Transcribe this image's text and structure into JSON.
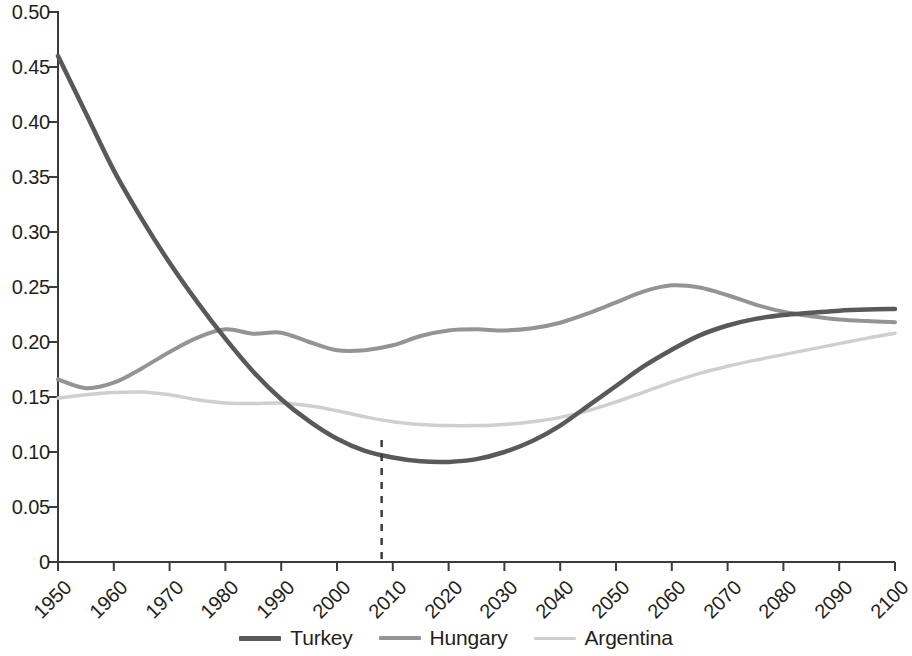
{
  "chart_data": {
    "type": "line",
    "title": "",
    "xlabel": "",
    "ylabel": "",
    "xlim": [
      1950,
      2100
    ],
    "ylim": [
      0,
      0.5
    ],
    "grid": false,
    "legend_position": "bottom",
    "x_ticks": [
      "1950",
      "1960",
      "1970",
      "1980",
      "1990",
      "2000",
      "2010",
      "2020",
      "2030",
      "2040",
      "2050",
      "2060",
      "2070",
      "2080",
      "2090",
      "2100"
    ],
    "y_ticks": [
      "0",
      "0.05",
      "0.10",
      "0.15",
      "0.20",
      "0.25",
      "0.30",
      "0.35",
      "0.40",
      "0.45",
      "0.50"
    ],
    "y_tick_values": [
      0,
      0.05,
      0.1,
      0.15,
      0.2,
      0.25,
      0.3,
      0.35,
      0.4,
      0.45,
      0.5
    ],
    "x": [
      1950,
      1955,
      1960,
      1965,
      1970,
      1975,
      1980,
      1985,
      1990,
      1995,
      2000,
      2005,
      2010,
      2015,
      2020,
      2025,
      2030,
      2035,
      2040,
      2045,
      2050,
      2055,
      2060,
      2065,
      2070,
      2075,
      2080,
      2085,
      2090,
      2095,
      2100
    ],
    "series": [
      {
        "name": "Turkey",
        "color": "#595959",
        "width": 4.5,
        "dash": "none",
        "values": [
          0.46,
          0.408,
          0.356,
          0.312,
          0.272,
          0.236,
          0.203,
          0.173,
          0.148,
          0.128,
          0.112,
          0.101,
          0.095,
          0.0915,
          0.091,
          0.0935,
          0.1,
          0.11,
          0.124,
          0.142,
          0.16,
          0.178,
          0.193,
          0.206,
          0.215,
          0.221,
          0.2245,
          0.2265,
          0.2285,
          0.2295,
          0.23
        ]
      },
      {
        "name": "Hungary",
        "color": "#949494",
        "width": 4.0,
        "dash": "none",
        "values": [
          0.166,
          0.158,
          0.163,
          0.176,
          0.191,
          0.204,
          0.2115,
          0.2075,
          0.2085,
          0.2,
          0.1925,
          0.1925,
          0.197,
          0.2055,
          0.2105,
          0.2115,
          0.2105,
          0.2125,
          0.2175,
          0.226,
          0.236,
          0.246,
          0.2515,
          0.2495,
          0.2425,
          0.234,
          0.2275,
          0.2235,
          0.2205,
          0.219,
          0.218
        ]
      },
      {
        "name": "Argentina",
        "color": "#cfcfcf",
        "width": 3.5,
        "dash": "none",
        "values": [
          0.149,
          0.152,
          0.154,
          0.1545,
          0.152,
          0.1475,
          0.1445,
          0.144,
          0.1445,
          0.142,
          0.1375,
          0.132,
          0.1275,
          0.125,
          0.124,
          0.124,
          0.125,
          0.1275,
          0.1315,
          0.1375,
          0.1455,
          0.1545,
          0.1635,
          0.1715,
          0.178,
          0.1835,
          0.1885,
          0.1935,
          0.1985,
          0.2035,
          0.208
        ]
      }
    ],
    "annotations": [
      {
        "name": "reference-line-2008",
        "type": "vline",
        "x": 2008,
        "y_top": 0.111,
        "y_bottom": 0,
        "style": "dashed",
        "color": "#3b3b3b"
      }
    ]
  },
  "axis": {
    "line_color": "#3b3b3b",
    "tick_color": "#3b3b3b"
  },
  "legend": {
    "items": [
      {
        "label": "Turkey",
        "color": "#595959"
      },
      {
        "label": "Hungary",
        "color": "#949494"
      },
      {
        "label": "Argentina",
        "color": "#cfcfcf"
      }
    ]
  }
}
